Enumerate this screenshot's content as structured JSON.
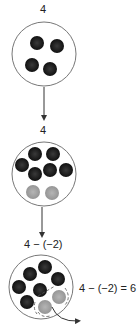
{
  "diagram": {
    "steps": [
      {
        "label": "4",
        "dark_counters": 4,
        "light_counters": 0
      },
      {
        "label": "4",
        "dark_counters": 6,
        "light_counters": 2
      },
      {
        "label": "4 − (−2)",
        "dark_counters": 6,
        "light_counters": 2,
        "removed": 2
      }
    ],
    "result": "4 − (−2) = 6",
    "colors": {
      "dark_counter": "#1a1a1a",
      "light_counter": "#a6a6a6",
      "outline": "#777777",
      "arrow": "#333333"
    }
  }
}
